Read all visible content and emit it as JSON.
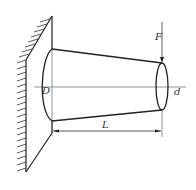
{
  "diagram": {
    "type": "cantilever tapered shaft (truncated cone) fixed at wall, transverse load at free end",
    "labels": {
      "force": "F",
      "large_diameter": "D",
      "small_diameter": "d",
      "length": "L"
    },
    "colors": {
      "stroke": "#222222",
      "thin_line": "#555555",
      "background": "#ffffff"
    }
  }
}
